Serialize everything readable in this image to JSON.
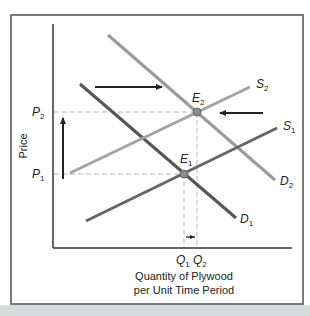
{
  "figure": {
    "y_axis_label": "Price",
    "x_axis_label_line1": "Quantity of Plywood",
    "x_axis_label_line2": "per Unit Time Period",
    "price_levels": [
      {
        "id": "P1",
        "letter": "P",
        "sub": "1"
      },
      {
        "id": "P2",
        "letter": "P",
        "sub": "2"
      }
    ],
    "quantity_levels": [
      {
        "id": "Q1",
        "letter": "Q",
        "sub": "1"
      },
      {
        "id": "Q2",
        "letter": "Q",
        "sub": "2"
      }
    ],
    "curves": [
      {
        "id": "D1",
        "letter": "D",
        "sub": "1",
        "kind": "demand",
        "color": "#555555"
      },
      {
        "id": "D2",
        "letter": "D",
        "sub": "2",
        "kind": "demand",
        "color": "#9a9a9a"
      },
      {
        "id": "S1",
        "letter": "S",
        "sub": "1",
        "kind": "supply",
        "color": "#666666"
      },
      {
        "id": "S2",
        "letter": "S",
        "sub": "2",
        "kind": "supply",
        "color": "#a3a3a3"
      }
    ],
    "equilibria": [
      {
        "id": "E1",
        "letter": "E",
        "sub": "1"
      },
      {
        "id": "E2",
        "letter": "E",
        "sub": "2"
      }
    ],
    "shift_arrows": [
      {
        "id": "demand-shift",
        "direction": "right"
      },
      {
        "id": "supply-shift",
        "direction": "left"
      },
      {
        "id": "price-rise",
        "direction": "up"
      },
      {
        "id": "quantity-rise",
        "direction": "right"
      }
    ],
    "colors": {
      "frame": "#7a7a7a",
      "axis": "#333333",
      "dashed_guides": "#b5b5b5",
      "arrows": "#222222",
      "equilibrium_point": "#8c8c8c"
    }
  }
}
